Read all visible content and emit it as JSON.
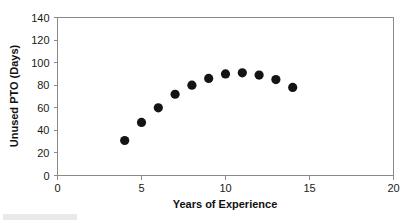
{
  "chart_data": {
    "type": "scatter",
    "title": "",
    "xlabel": "Years of Experience",
    "ylabel": "Unused PTO (Days)",
    "xlim": [
      0,
      20
    ],
    "ylim": [
      0,
      140
    ],
    "xticks": [
      0,
      5,
      10,
      15,
      20
    ],
    "yticks": [
      0,
      20,
      40,
      60,
      80,
      100,
      120,
      140
    ],
    "xtick_labels": [
      "0",
      "5",
      "10",
      "15",
      "20"
    ],
    "ytick_labels": [
      "0",
      "20",
      "40",
      "60",
      "80",
      "100",
      "120",
      "140"
    ],
    "grid": false,
    "legend": false,
    "marker": "filled-circle",
    "marker_color": "#141414",
    "axis_color": "#8a8a8a",
    "x": [
      4,
      5,
      6,
      7,
      8,
      9,
      10,
      11,
      12,
      13,
      14
    ],
    "y": [
      31,
      47,
      60,
      72,
      80,
      86,
      90,
      91,
      89,
      85,
      78
    ],
    "points": [
      {
        "x": 4,
        "y": 31
      },
      {
        "x": 5,
        "y": 47
      },
      {
        "x": 6,
        "y": 60
      },
      {
        "x": 7,
        "y": 72
      },
      {
        "x": 8,
        "y": 80
      },
      {
        "x": 9,
        "y": 86
      },
      {
        "x": 10,
        "y": 90
      },
      {
        "x": 11,
        "y": 91
      },
      {
        "x": 12,
        "y": 89
      },
      {
        "x": 13,
        "y": 85
      },
      {
        "x": 14,
        "y": 78
      }
    ]
  },
  "figure": {
    "x_axis_title": "Years of Experience",
    "y_axis_title": "Unused PTO (Days)"
  }
}
